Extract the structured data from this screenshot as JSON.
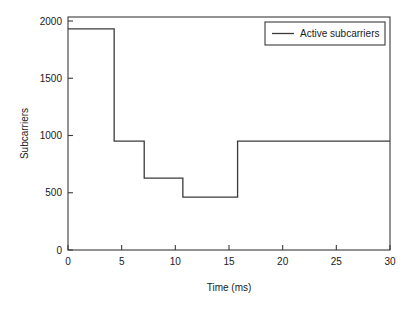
{
  "chart_data": {
    "type": "line",
    "title": "",
    "subtitle": "",
    "xlabel": "Time (ms)",
    "ylabel": "Subcarriers",
    "xlim": [
      0,
      30
    ],
    "ylim": [
      0,
      2075
    ],
    "grid": false,
    "legend_position": "top-right",
    "step_style": "post",
    "xticks": [
      0,
      5,
      10,
      15,
      20,
      25,
      30
    ],
    "xtick_labels": [
      "0",
      "5",
      "10",
      "15",
      "20",
      "25",
      "30"
    ],
    "yticks": [
      0,
      500,
      1000,
      1500,
      2000
    ],
    "ytick_labels": [
      "0",
      "500",
      "1000",
      "1500",
      "2000"
    ],
    "series": [
      {
        "name": "Active subcarriers",
        "color": "#3a3a3a",
        "x": [
          0.0,
          4.3,
          4.3,
          7.1,
          7.1,
          10.7,
          10.7,
          15.8,
          15.8,
          30.0
        ],
        "values": [
          1970,
          1970,
          970,
          970,
          640,
          640,
          470,
          470,
          970,
          970
        ],
        "segments": [
          {
            "x_start": 0.0,
            "x_end": 4.3,
            "y": 1970
          },
          {
            "x_start": 4.3,
            "x_end": 7.1,
            "y": 970
          },
          {
            "x_start": 7.1,
            "x_end": 10.7,
            "y": 640
          },
          {
            "x_start": 10.7,
            "x_end": 15.8,
            "y": 470
          },
          {
            "x_start": 15.8,
            "x_end": 30.0,
            "y": 970
          }
        ]
      }
    ],
    "legend": [
      {
        "label": "Active subcarriers",
        "color": "#3a3a3a"
      }
    ]
  },
  "axes": {
    "ylabel": "Subcarriers",
    "xlabel": "Time (ms)",
    "ytick_0": "0",
    "ytick_1": "500",
    "ytick_2": "1000",
    "ytick_3": "1500",
    "ytick_4": "2000",
    "xtick_0": "0",
    "xtick_1": "5",
    "xtick_2": "10",
    "xtick_3": "15",
    "xtick_4": "20",
    "xtick_5": "25",
    "xtick_6": "30"
  },
  "legend": {
    "entry_0_label": "Active subcarriers"
  },
  "colors": {
    "line": "#3a3a3a",
    "frame": "#3a3a3a",
    "text": "#1a1a1a",
    "background": "#ffffff"
  }
}
